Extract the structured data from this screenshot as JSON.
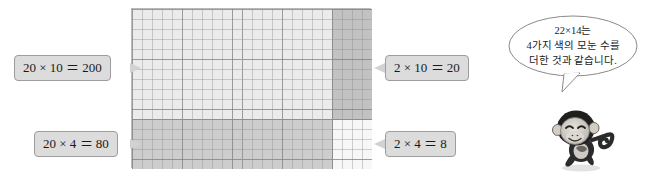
{
  "diagram": {
    "grid": {
      "total_columns": 22,
      "total_rows": 14,
      "unit_cell_px": 10,
      "split_column": 20,
      "split_row": 10
    },
    "regions": [
      {
        "key": "top_left",
        "label": "20 × 10 ＝ 200",
        "factor_a": 20,
        "factor_b": 10,
        "product": 200,
        "color": "#ebebeb"
      },
      {
        "key": "top_right",
        "label": "2 × 10 ＝ 20",
        "factor_a": 2,
        "factor_b": 10,
        "product": 20,
        "color": "#c2c2c2"
      },
      {
        "key": "bottom_left",
        "label": "20 × 4 ＝ 80",
        "factor_a": 20,
        "factor_b": 4,
        "product": 80,
        "color": "#cdcdcd"
      },
      {
        "key": "bottom_right",
        "label": "2 × 4 ＝ 8",
        "factor_a": 2,
        "factor_b": 4,
        "product": 8,
        "color": "#f7f7f7"
      }
    ]
  },
  "callouts": {
    "top_left": "20 × 10 ＝ 200",
    "top_right": "2 × 10 ＝ 20",
    "bottom_left": "20 × 4 ＝ 80",
    "bottom_right": "2 × 4 ＝ 8"
  },
  "speech": {
    "line1": "22×14는",
    "line2": "4가지 색의 모눈 수를",
    "line3": "더한 것과 같습니다.",
    "full": "22×14는 4가지 색의 모눈 수를 더한 것과 같습니다."
  },
  "character": {
    "name": "monkey-mascot"
  }
}
